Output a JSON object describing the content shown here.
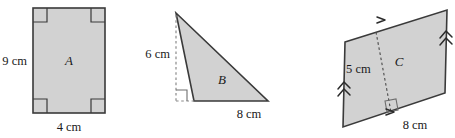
{
  "figure": {
    "background_color": "#ffffff",
    "fill_color": "#d2d2d2",
    "stroke_color": "#3a3a3a",
    "dash_color": "#8a8a8a",
    "text_color": "#1a1a1a"
  },
  "shapes": [
    {
      "id": "A",
      "kind": "rectangle",
      "letter_label": "A",
      "dimensions": [
        {
          "name": "height",
          "text": "9 cm",
          "value": 9,
          "unit": "cm",
          "position": "left"
        },
        {
          "name": "width",
          "text": "4 cm",
          "value": 4,
          "unit": "cm",
          "position": "bottom"
        }
      ],
      "right_angle_markers": 4,
      "marker_positions": [
        "top-left",
        "top-right",
        "bottom-left",
        "bottom-right"
      ]
    },
    {
      "id": "B",
      "kind": "triangle",
      "letter_label": "B",
      "dimensions": [
        {
          "name": "height",
          "text": "6 cm",
          "value": 6,
          "unit": "cm",
          "position": "left",
          "style": "dashed"
        },
        {
          "name": "base",
          "text": "8 cm",
          "value": 8,
          "unit": "cm",
          "position": "bottom"
        }
      ],
      "right_angle_markers": 1,
      "marker_positions": [
        "base-foot-of-height"
      ]
    },
    {
      "id": "C",
      "kind": "parallelogram",
      "letter_label": "C",
      "dimensions": [
        {
          "name": "height",
          "text": "5 cm",
          "value": 5,
          "unit": "cm",
          "position": "interior",
          "style": "dashed"
        },
        {
          "name": "base",
          "text": "8 cm",
          "value": 8,
          "unit": "cm",
          "position": "bottom"
        }
      ],
      "right_angle_markers": 1,
      "marker_positions": [
        "base-foot-of-height"
      ],
      "parallel_marks": [
        {
          "edge": "top",
          "chevrons": 1,
          "direction": "right"
        },
        {
          "edge": "bottom",
          "chevrons": 1,
          "direction": "right"
        },
        {
          "edge": "left",
          "chevrons": 2,
          "direction": "up"
        },
        {
          "edge": "right",
          "chevrons": 2,
          "direction": "up"
        }
      ]
    }
  ],
  "labels": {
    "a_letter": "A",
    "a_height": "9 cm",
    "a_width": "4 cm",
    "b_letter": "B",
    "b_height": "6 cm",
    "b_base": "8 cm",
    "c_letter": "C",
    "c_height": "5 cm",
    "c_base": "8 cm"
  }
}
